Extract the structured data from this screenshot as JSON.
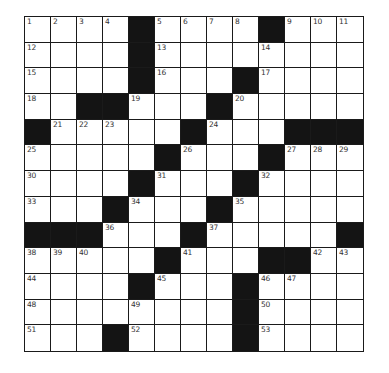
{
  "puzzle": {
    "rows": 13,
    "cols": 13,
    "colors": {
      "black": "#141414",
      "white": "#ffffff",
      "line": "#1a1a1a",
      "number": "#333333"
    },
    "layout": [
      "....#....#...",
      "....#........",
      "....#...#....",
      "..##...#.....",
      "#.....#...###",
      ".....#...#...",
      "....#...#....",
      "...#...#.....",
      "###...#.....#",
      ".....#...##..",
      "....#...#....",
      "........#....",
      "...#....#...."
    ],
    "numbers": [
      [
        "1",
        "2",
        "3",
        "4",
        "",
        "5",
        "6",
        "7",
        "8",
        "",
        "9",
        "10",
        "11"
      ],
      [
        "12",
        "",
        "",
        "",
        "",
        "13",
        "",
        "",
        "",
        "14",
        "",
        "",
        ""
      ],
      [
        "15",
        "",
        "",
        "",
        "",
        "16",
        "",
        "",
        "",
        "17",
        "",
        "",
        ""
      ],
      [
        "18",
        "",
        "",
        "",
        "19",
        "",
        "",
        "",
        "20",
        "",
        "",
        "",
        ""
      ],
      [
        "",
        "21",
        "22",
        "23",
        "",
        "",
        "",
        "24",
        "",
        "",
        "",
        "",
        ""
      ],
      [
        "25",
        "",
        "",
        "",
        "",
        "",
        "26",
        "",
        "",
        "",
        "27",
        "28",
        "29"
      ],
      [
        "30",
        "",
        "",
        "",
        "",
        "31",
        "",
        "",
        "",
        "32",
        "",
        "",
        ""
      ],
      [
        "33",
        "",
        "",
        "",
        "34",
        "",
        "",
        "",
        "35",
        "",
        "",
        "",
        ""
      ],
      [
        "",
        "",
        "",
        "36",
        "",
        "",
        "",
        "37",
        "",
        "",
        "",
        "",
        ""
      ],
      [
        "38",
        "39",
        "40",
        "",
        "",
        "",
        "41",
        "",
        "",
        "",
        "",
        "42",
        "43"
      ],
      [
        "44",
        "",
        "",
        "",
        "",
        "45",
        "",
        "",
        "",
        "46",
        "47",
        "",
        ""
      ],
      [
        "48",
        "",
        "",
        "",
        "49",
        "",
        "",
        "",
        "",
        "50",
        "",
        "",
        ""
      ],
      [
        "51",
        "",
        "",
        "",
        "52",
        "",
        "",
        "",
        "",
        "53",
        "",
        "",
        ""
      ]
    ]
  }
}
